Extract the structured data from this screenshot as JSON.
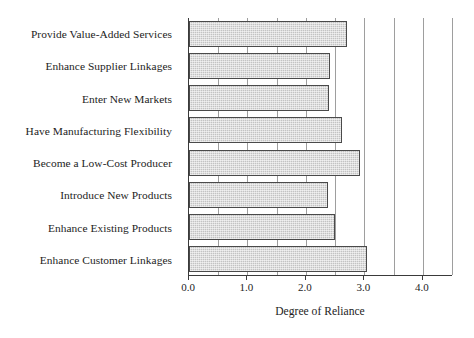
{
  "chart_data": {
    "type": "bar",
    "orientation": "horizontal",
    "title": "",
    "xlabel": "Degree of Reliance",
    "ylabel": "",
    "xlim": [
      0.0,
      4.5
    ],
    "grid": true,
    "grid_axis": "x",
    "legend": "none",
    "categories": [
      "Provide Value-Added Services",
      "Enhance Supplier Linkages",
      "Enter New Markets",
      "Have Manufacturing Flexibility",
      "Become a Low-Cost Producer",
      "Introduce New Products",
      "Enhance Existing Products",
      "Enhance Customer Linkages"
    ],
    "values": [
      2.7,
      2.42,
      2.4,
      2.62,
      2.92,
      2.38,
      2.5,
      3.05
    ],
    "xticks": [
      0.0,
      1.0,
      2.0,
      3.0,
      4.0
    ],
    "xticklabels": [
      "0.0",
      "1.0",
      "2.0",
      "3.0",
      "4.0"
    ],
    "gridline_positions": [
      0.5,
      1.0,
      1.5,
      2.0,
      2.5,
      3.0,
      3.5,
      4.0,
      4.5
    ],
    "bar_fill_color": "#c3c3c3",
    "bar_edge_color": "#4a4a4a",
    "axis_color": "#3a3a3a",
    "gridline_color": "#8d8d8d",
    "background_color": "#ffffff"
  }
}
